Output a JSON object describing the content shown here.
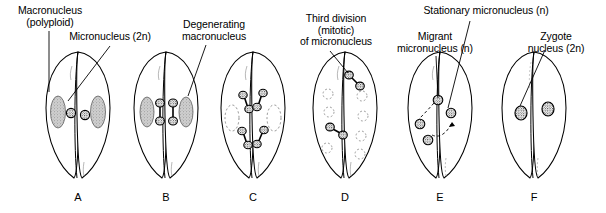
{
  "figure": {
    "background": "#ffffff",
    "ink": "#000000",
    "macronucleus_fill": "#b9b9b9",
    "panel_count": 6
  },
  "labels": [
    {
      "id": "macronucleus",
      "text": "Macronucleus\n(polyploid)",
      "x": 3,
      "y": 5,
      "w": 94,
      "leader": {
        "x1": 49,
        "y1": 31,
        "x2": 49,
        "y2": 92
      }
    },
    {
      "id": "micronucleus",
      "text": "Micronucleus (2n)",
      "x": 62,
      "y": 31,
      "w": 96,
      "leader": {
        "x1": 110,
        "y1": 46,
        "x2": 68,
        "y2": 101
      }
    },
    {
      "id": "degenerating-macronucleus",
      "text": "Degenerating\nmacronucleus",
      "x": 172,
      "y": 19,
      "w": 84,
      "leader": {
        "x1": 206,
        "y1": 45,
        "x2": 188,
        "y2": 96
      }
    },
    {
      "id": "third-division",
      "text": "Third division\n(mitotic)\nof micronucleus",
      "x": 290,
      "y": 13,
      "w": 92,
      "leader": {
        "x1": 330,
        "y1": 51,
        "x2": 348,
        "y2": 73
      }
    },
    {
      "id": "migrant-micronucleus",
      "text": "Migrant\nmicronucleus (n)",
      "x": 389,
      "y": 31,
      "w": 92,
      "leader": {
        "x1": 436,
        "y1": 56,
        "x2": 438,
        "y2": 98
      }
    },
    {
      "id": "stationary-micronucleus",
      "text": "Stationary micronucleus (n)",
      "x": 411,
      "y": 5,
      "w": 150,
      "leader": {
        "x1": 470,
        "y1": 21,
        "x2": 448,
        "y2": 108
      }
    },
    {
      "id": "zygote-nucleus",
      "text": "Zygote\nnucleus (2n)",
      "x": 515,
      "y": 31,
      "w": 82,
      "leader": {
        "x1": 545,
        "y1": 50,
        "x2": 520,
        "y2": 106
      }
    }
  ],
  "panels": [
    {
      "letter": "A",
      "cx": 78,
      "label_x": 58,
      "label_y": 191
    },
    {
      "letter": "B",
      "cx": 166,
      "label_x": 146,
      "label_y": 191
    },
    {
      "letter": "C",
      "cx": 253,
      "label_x": 233,
      "label_y": 191
    },
    {
      "letter": "D",
      "cx": 345,
      "label_x": 325,
      "label_y": 191
    },
    {
      "letter": "E",
      "cx": 440,
      "label_x": 420,
      "label_y": 191
    },
    {
      "letter": "F",
      "cx": 534,
      "label_x": 514,
      "label_y": 191
    }
  ],
  "legend_terms": [
    "Macronucleus (polyploid)",
    "Micronucleus (2n)",
    "Degenerating macronucleus",
    "Third division (mitotic) of micronucleus",
    "Migrant micronucleus (n)",
    "Stationary micronucleus (n)",
    "Zygote nucleus (2n)"
  ]
}
